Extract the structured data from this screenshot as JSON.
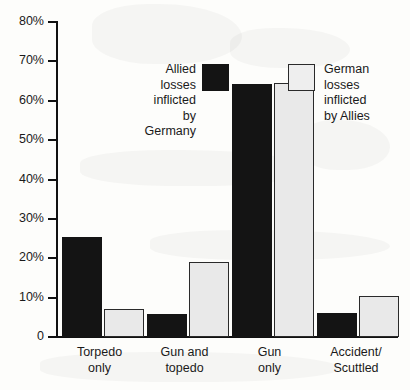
{
  "chart_data": {
    "type": "bar",
    "title": "",
    "subtitle": "",
    "xlabel": "",
    "ylabel": "",
    "ylim": [
      0,
      80
    ],
    "grid": false,
    "legend_position": "inside-top",
    "categories": [
      "Torpedo\nonly",
      "Gun and\ntopedo",
      "Gun\nonly",
      "Accident/\nScuttled"
    ],
    "category_lines": [
      [
        "Torpedo",
        "only"
      ],
      [
        "Gun and",
        "topedo"
      ],
      [
        "Gun",
        "only"
      ],
      [
        "Accident/",
        "Scuttled"
      ]
    ],
    "ytick_labels": [
      "80%",
      "70%",
      "60%",
      "50%",
      "40%",
      "30%",
      "20%",
      "10%",
      "0"
    ],
    "ytick_values": [
      80,
      70,
      60,
      50,
      40,
      30,
      20,
      10,
      0
    ],
    "series": [
      {
        "name": "Allied losses inflicted by Germany",
        "name_lines": [
          "Allied",
          "losses",
          "inflicted",
          "by Germany"
        ],
        "color": "#141414",
        "values": [
          25.3,
          5.8,
          64.2,
          6.0
        ]
      },
      {
        "name": "German losses inflicted by Allies",
        "name_lines": [
          "German",
          "losses",
          "inflicted",
          "by Allies"
        ],
        "color": "#e9e9e9",
        "values": [
          7.0,
          19.0,
          64.6,
          10.5
        ]
      }
    ]
  },
  "legend": {
    "allied": {
      "line1": "Allied",
      "line2": "losses",
      "line3": "inflicted",
      "line4": "by Germany"
    },
    "german": {
      "line1": "German",
      "line2": "losses",
      "line3": "inflicted",
      "line4": "by Allies"
    }
  },
  "yaxis": {
    "t80": "80%",
    "t70": "70%",
    "t60": "60%",
    "t50": "50%",
    "t40": "40%",
    "t30": "30%",
    "t20": "20%",
    "t10": "10%",
    "t0": "0"
  },
  "categories": {
    "c0l1": "Torpedo",
    "c0l2": "only",
    "c1l1": "Gun and",
    "c1l2": "topedo",
    "c2l1": "Gun",
    "c2l2": "only",
    "c3l1": "Accident/",
    "c3l2": "Scuttled"
  }
}
